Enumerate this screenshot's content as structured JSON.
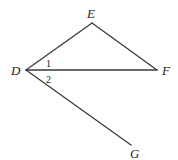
{
  "diagram": {
    "points": {
      "D": {
        "label": "D",
        "x": 26,
        "y": 70
      },
      "E": {
        "label": "E",
        "x": 92,
        "y": 23
      },
      "F": {
        "label": "F",
        "x": 157,
        "y": 70
      },
      "G": {
        "label": "G",
        "x": 131,
        "y": 145
      }
    },
    "segments": [
      "DE",
      "EF",
      "DF",
      "DG"
    ],
    "angle_labels": [
      {
        "label": "1",
        "between": "EDF"
      },
      {
        "label": "2",
        "between": "FDG"
      }
    ]
  }
}
